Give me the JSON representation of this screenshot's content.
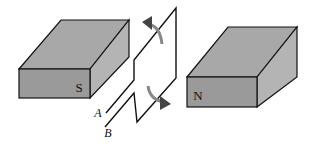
{
  "diagram": {
    "magnets": [
      {
        "pole": "S",
        "position": "left"
      },
      {
        "pole": "N",
        "position": "right"
      }
    ],
    "leads": [
      {
        "label": "A"
      },
      {
        "label": "B"
      }
    ],
    "rotation_arrows": [
      "upper-arrow",
      "lower-arrow"
    ],
    "colors": {
      "magnet_front": "#9a9a9a",
      "magnet_top": "#a8a8a8",
      "magnet_side": "#b4b4b4",
      "outline": "#111111",
      "arrow": "#555555"
    }
  }
}
